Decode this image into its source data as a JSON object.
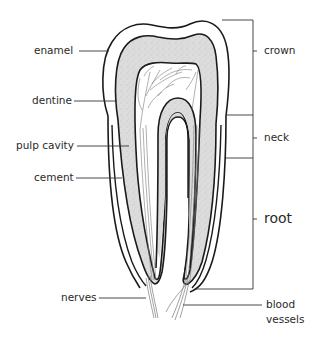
{
  "diagram": {
    "colors": {
      "outline": "#1a1a1a",
      "dentine_fill": "#d9d9d9",
      "enamel_fill": "#ffffff",
      "pulp_fill": "#ffffff",
      "nerve": "#7a7a7a",
      "leader_line": "#333333",
      "text": "#2a2a2a"
    },
    "left_labels": [
      {
        "id": "enamel",
        "text": "enamel"
      },
      {
        "id": "dentine",
        "text": "dentine"
      },
      {
        "id": "pulp_cavity",
        "text": "pulp cavity"
      },
      {
        "id": "cement",
        "text": "cement"
      },
      {
        "id": "nerves",
        "text": "nerves"
      }
    ],
    "right_labels": [
      {
        "id": "crown",
        "text": "crown"
      },
      {
        "id": "neck",
        "text": "neck"
      },
      {
        "id": "root",
        "text": "root"
      },
      {
        "id": "blood_vessels_1",
        "text": "blood"
      },
      {
        "id": "blood_vessels_2",
        "text": "vessels"
      }
    ]
  }
}
